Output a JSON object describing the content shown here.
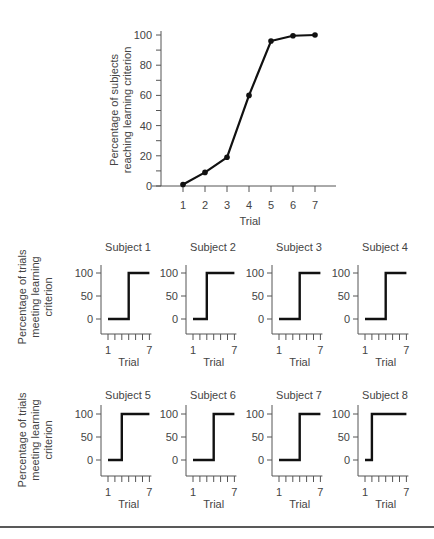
{
  "chart_data": [
    {
      "type": "line",
      "title": "",
      "xlabel": "Trial",
      "ylabel": "Percentage of subjects reaching learning criterion",
      "ylabel_lines": [
        "Percentage of subjects",
        "reaching learning criterion"
      ],
      "x": [
        1,
        2,
        3,
        4,
        5,
        6,
        7
      ],
      "values": [
        1,
        9,
        19,
        60,
        96,
        99.5,
        100
      ],
      "xticks": [
        "1",
        "2",
        "3",
        "4",
        "5",
        "6",
        "7"
      ],
      "yticks": [
        "0",
        "20",
        "40",
        "60",
        "80",
        "100"
      ],
      "ylim": [
        0,
        100
      ],
      "grid": false,
      "markers": true
    },
    {
      "type": "line",
      "subtype": "step",
      "shared_ylabel": "Percentage of trials meeting learning criterion",
      "shared_ylabel_lines": [
        "Percentage of trials",
        "meeting learning",
        "criterion"
      ],
      "xlabel": "Trial",
      "xticks_labeled": [
        "1",
        "7"
      ],
      "yticks": [
        "0",
        "50",
        "100"
      ],
      "x": [
        1,
        2,
        3,
        4,
        5,
        6,
        7
      ],
      "ylim": [
        0,
        100
      ],
      "panels": [
        {
          "title": "Subject 1",
          "values": [
            0,
            0,
            0,
            100,
            100,
            100,
            100
          ]
        },
        {
          "title": "Subject 2",
          "values": [
            0,
            0,
            100,
            100,
            100,
            100,
            100
          ]
        },
        {
          "title": "Subject 3",
          "values": [
            0,
            0,
            0,
            100,
            100,
            100,
            100
          ]
        },
        {
          "title": "Subject 4",
          "values": [
            0,
            0,
            0,
            100,
            100,
            100,
            100
          ]
        },
        {
          "title": "Subject 5",
          "values": [
            0,
            0,
            100,
            100,
            100,
            100,
            100
          ]
        },
        {
          "title": "Subject 6",
          "values": [
            0,
            0,
            0,
            100,
            100,
            100,
            100
          ]
        },
        {
          "title": "Subject 7",
          "values": [
            0,
            0,
            0,
            100,
            100,
            100,
            100
          ]
        },
        {
          "title": "Subject 8",
          "values": [
            0,
            100,
            100,
            100,
            100,
            100,
            100
          ]
        }
      ]
    }
  ]
}
